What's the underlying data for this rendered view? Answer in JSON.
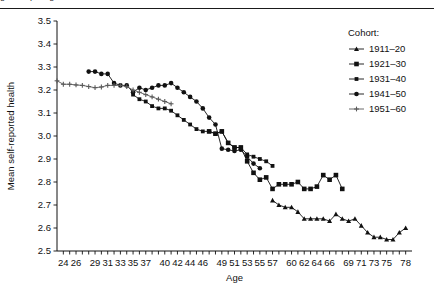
{
  "page": {
    "cropped_header_text": "ged  ... p ... g"
  },
  "chart_data": {
    "type": "line",
    "title": "",
    "xlabel": "Age",
    "ylabel": "Mean self-reported health",
    "xlim": [
      23,
      79
    ],
    "ylim": [
      2.5,
      3.5
    ],
    "grid": false,
    "legend_position": "top-right",
    "legend_title": "Cohort:",
    "x_ticks_all": [
      24,
      25,
      26,
      27,
      28,
      29,
      30,
      31,
      32,
      33,
      34,
      35,
      36,
      37,
      38,
      39,
      40,
      41,
      42,
      43,
      44,
      45,
      46,
      47,
      48,
      49,
      50,
      51,
      52,
      53,
      54,
      55,
      56,
      57,
      58,
      59,
      60,
      61,
      62,
      63,
      64,
      65,
      66,
      67,
      68,
      69,
      70,
      71,
      72,
      73,
      74,
      75,
      76,
      77,
      78
    ],
    "x_tick_labels": [
      24,
      26,
      29,
      31,
      33,
      35,
      37,
      40,
      42,
      44,
      46,
      49,
      51,
      53,
      55,
      57,
      60,
      62,
      64,
      66,
      69,
      71,
      73,
      75,
      78
    ],
    "y_ticks": [
      2.5,
      2.6,
      2.7,
      2.8,
      2.9,
      3.0,
      3.1,
      3.2,
      3.3,
      3.4,
      3.5
    ],
    "y_tick_labels": [
      "2.5",
      "2.6",
      "2.7",
      "2.8",
      "2.9",
      "3.0",
      "3.1",
      "3.2",
      "3.3",
      "3.4",
      "3.5"
    ],
    "series": [
      {
        "name": "1911–20",
        "marker": "triangle",
        "color": "#111111",
        "x": [
          57,
          58,
          59,
          60,
          61,
          62,
          63,
          64,
          65,
          66,
          67,
          68,
          69,
          70,
          71,
          72,
          73,
          74,
          75,
          76,
          77,
          78
        ],
        "values": [
          2.72,
          2.7,
          2.69,
          2.69,
          2.67,
          2.64,
          2.64,
          2.64,
          2.64,
          2.63,
          2.66,
          2.64,
          2.63,
          2.64,
          2.61,
          2.58,
          2.56,
          2.56,
          2.55,
          2.55,
          2.58,
          2.6
        ]
      },
      {
        "name": "1921–30",
        "marker": "square",
        "color": "#111111",
        "x": [
          47,
          48,
          49,
          50,
          51,
          52,
          53,
          54,
          55,
          56,
          57,
          58,
          59,
          60,
          61,
          62,
          63,
          64,
          65,
          66,
          67,
          68
        ],
        "values": [
          3.02,
          3.01,
          3.02,
          2.97,
          2.95,
          2.95,
          2.89,
          2.84,
          2.81,
          2.82,
          2.77,
          2.79,
          2.79,
          2.79,
          2.8,
          2.77,
          2.77,
          2.78,
          2.83,
          2.81,
          2.83,
          2.77
        ]
      },
      {
        "name": "1931–40",
        "marker": "small-square",
        "color": "#111111",
        "x": [
          35,
          36,
          37,
          38,
          39,
          40,
          41,
          42,
          43,
          44,
          45,
          46,
          47,
          48,
          49,
          50,
          51,
          52,
          53,
          54,
          55,
          56,
          57
        ],
        "values": [
          3.18,
          3.16,
          3.15,
          3.13,
          3.12,
          3.12,
          3.11,
          3.09,
          3.07,
          3.05,
          3.03,
          3.02,
          3.02,
          3.01,
          3.02,
          2.97,
          2.95,
          2.95,
          2.92,
          2.91,
          2.9,
          2.89,
          2.87
        ]
      },
      {
        "name": "1941–50",
        "marker": "circle",
        "color": "#111111",
        "x": [
          28,
          29,
          30,
          31,
          32,
          33,
          34,
          35,
          36,
          37,
          38,
          39,
          40,
          41,
          42,
          43,
          44,
          45,
          46,
          47,
          48,
          49,
          50,
          51,
          52,
          53,
          54,
          55
        ],
        "values": [
          3.28,
          3.28,
          3.27,
          3.27,
          3.23,
          3.22,
          3.22,
          3.19,
          3.21,
          3.2,
          3.21,
          3.22,
          3.22,
          3.23,
          3.21,
          3.19,
          3.17,
          3.15,
          3.12,
          3.08,
          3.05,
          2.945,
          2.94,
          2.935,
          2.94,
          2.91,
          2.88,
          2.86
        ]
      },
      {
        "name": "1951–60",
        "marker": "plus",
        "color": "#5a5a5a",
        "x": [
          23,
          24,
          25,
          26,
          27,
          28,
          29,
          30,
          31,
          32,
          33,
          34,
          35,
          36,
          37,
          38,
          39,
          40,
          41
        ],
        "values": [
          3.24,
          3.225,
          3.225,
          3.222,
          3.22,
          3.215,
          3.21,
          3.213,
          3.22,
          3.22,
          3.22,
          3.215,
          3.2,
          3.19,
          3.18,
          3.17,
          3.16,
          3.15,
          3.14
        ]
      }
    ]
  }
}
